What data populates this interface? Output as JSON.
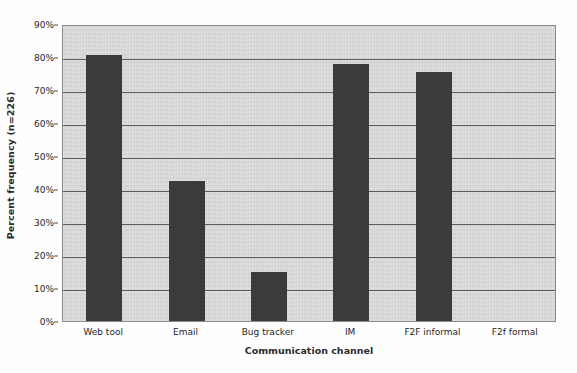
{
  "chart_data": {
    "type": "bar",
    "title": "",
    "subtitle": "",
    "xlabel": "Communication channel",
    "ylabel": "Percent frequency (n=226)",
    "categories": [
      "Web tool",
      "Email",
      "Bug tracker",
      "IM",
      "F2F informal",
      "F2f formal"
    ],
    "values": [
      80.5,
      42.5,
      15.0,
      78.0,
      75.5,
      0
    ],
    "series": [
      {
        "name": "Percent frequency",
        "values": [
          80.5,
          42.5,
          15.0,
          78.0,
          75.5,
          0
        ]
      }
    ],
    "ylim": [
      0,
      90
    ],
    "ytick_values": [
      0,
      10,
      20,
      30,
      40,
      50,
      60,
      70,
      80,
      90
    ],
    "ytick_labels": [
      "0%",
      "10%",
      "20%",
      "30%",
      "40%",
      "50%",
      "60%",
      "70%",
      "80%",
      "90%"
    ],
    "grid": true,
    "grid_axis": "y",
    "legend": false,
    "legend_position": "none",
    "sample_size": 226,
    "bar_color": "#3b3b3b",
    "plot_background_color": "#d5d5d5",
    "gridline_color": "#5c5c5c",
    "axis_color": "#4a4a4a",
    "figure_background_color": "#ffffff",
    "annotations": []
  }
}
